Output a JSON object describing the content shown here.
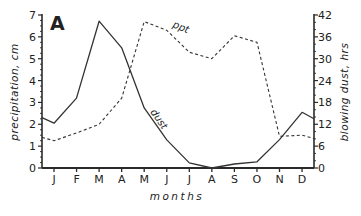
{
  "chart_data": {
    "type": "line",
    "panel_label": "A",
    "title": "",
    "xlabel": "months",
    "ylabel_left": "precipitation, cm",
    "ylabel_right": "blowing dust, hrs",
    "categories": [
      "J",
      "F",
      "M",
      "A",
      "M",
      "J",
      "J",
      "A",
      "S",
      "O",
      "N",
      "D"
    ],
    "left_axis": {
      "ylim": [
        0,
        7
      ],
      "ticks": [
        0,
        1,
        2,
        3,
        4,
        5,
        6,
        7
      ]
    },
    "right_axis": {
      "ylim": [
        0,
        42
      ],
      "ticks": [
        0,
        6,
        12,
        18,
        24,
        30,
        36,
        42
      ]
    },
    "grid": false,
    "legend": "inline labels on lines",
    "series": [
      {
        "name": "ppt",
        "axis": "left",
        "units": "cm",
        "style": "dashed",
        "values": [
          1.25,
          1.6,
          2.0,
          3.2,
          6.7,
          6.3,
          5.3,
          5.0,
          6.05,
          5.75,
          1.45,
          1.5
        ],
        "start_value": 1.4,
        "end_value": 1.35
      },
      {
        "name": "dust",
        "axis": "right",
        "units": "hrs",
        "style": "solid",
        "values": [
          12.3,
          19.2,
          40.3,
          33.0,
          16.5,
          7.7,
          1.4,
          0.0,
          1.1,
          1.7,
          7.8,
          15.3
        ],
        "start_value": 13.8,
        "end_value": 13.5
      }
    ]
  }
}
